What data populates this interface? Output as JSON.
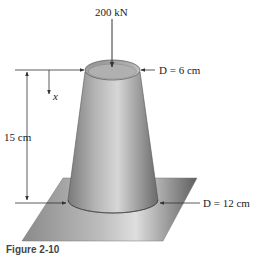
{
  "figure": {
    "load": {
      "label": "200 kN"
    },
    "top_diameter": {
      "label": "D = 6 cm"
    },
    "bottom_diameter": {
      "label": "D = 12 cm"
    },
    "height": {
      "label": "15 cm"
    },
    "coordinate": {
      "label": "x"
    },
    "caption": "Figure 2-10"
  },
  "colors": {
    "cone_light": "#d8d8d8",
    "cone_mid": "#a8a8a8",
    "cone_dark": "#6a6a6a",
    "plate_dark": "#6e6e6e",
    "plate_light": "#cfcfcf",
    "line": "#333333"
  }
}
